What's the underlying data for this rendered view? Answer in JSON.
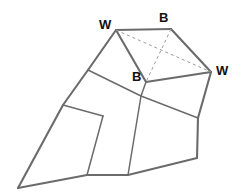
{
  "diagram": {
    "type": "line-diagram",
    "canvas": {
      "width": 242,
      "height": 194,
      "background": "#ffffff"
    },
    "style": {
      "solid_stroke_color": "#6b6b6b",
      "dashed_stroke_color": "#9a9a9a",
      "solid_stroke_width": 2.1,
      "thin_stroke_width": 1.5,
      "dashed_stroke_width": 1,
      "dash_pattern": "3,3",
      "label_color": "#111111",
      "label_font_size": 13
    },
    "vertices": {
      "W_top_left": {
        "x": 116,
        "y": 30
      },
      "B_top_right": {
        "x": 171,
        "y": 29
      },
      "W_right": {
        "x": 211,
        "y": 72
      },
      "B_center": {
        "x": 146,
        "y": 82
      },
      "left_edge_mid": {
        "x": 88,
        "y": 70
      },
      "left_edge_lower": {
        "x": 63,
        "y": 105
      },
      "cell_join_left": {
        "x": 103,
        "y": 116
      },
      "cell_join_upper": {
        "x": 141,
        "y": 96
      },
      "right_mid": {
        "x": 198,
        "y": 118
      },
      "bottom_left": {
        "x": 18,
        "y": 188
      },
      "bottom_mid_a": {
        "x": 87,
        "y": 175
      },
      "bottom_mid_b": {
        "x": 128,
        "y": 175
      },
      "bottom_right": {
        "x": 197,
        "y": 158
      }
    },
    "solid_edges": [
      {
        "name": "top-edge-W-to-B",
        "points": "116,30 171,29"
      },
      {
        "name": "upper-right-edge-B-to-W",
        "points": "171,29 211,72"
      },
      {
        "name": "inner-edge-W-to-B-center",
        "points": "116,30 146,82"
      },
      {
        "name": "inner-edge-B-center-to-W-right",
        "points": "146,82 211,72"
      },
      {
        "name": "left-outer-edge",
        "points": "116,30 88,70 63,105 18,188"
      },
      {
        "name": "bottom-outer-edge",
        "points": "18,188 87,175 128,175 197,158"
      },
      {
        "name": "right-outer-edge",
        "points": "211,72 198,118 197,158"
      },
      {
        "name": "divider-left-mid-to-center",
        "points": "88,70 141,96"
      },
      {
        "name": "divider-center-to-right-mid",
        "points": "141,96 198,118"
      },
      {
        "name": "divider-lower-left-horizontal",
        "points": "63,105 103,116"
      },
      {
        "name": "divider-B-center-down",
        "points": "146,82 141,96"
      },
      {
        "name": "divider-upper-vertical-left",
        "points": "103,116 87,175"
      },
      {
        "name": "divider-center-vertical",
        "points": "141,96 128,175"
      }
    ],
    "dashed_edges": [
      {
        "name": "diagonal-W-to-W",
        "points": "116,30 211,72"
      },
      {
        "name": "diagonal-B-to-B",
        "points": "171,29 146,82"
      }
    ],
    "labels": [
      {
        "name": "label-w-top-left",
        "text": "W",
        "x": 99,
        "y": 18
      },
      {
        "name": "label-b-top-right",
        "text": "B",
        "x": 159,
        "y": 11
      },
      {
        "name": "label-w-right",
        "text": "W",
        "x": 216,
        "y": 64
      },
      {
        "name": "label-b-center",
        "text": "B",
        "x": 132,
        "y": 70
      }
    ]
  }
}
